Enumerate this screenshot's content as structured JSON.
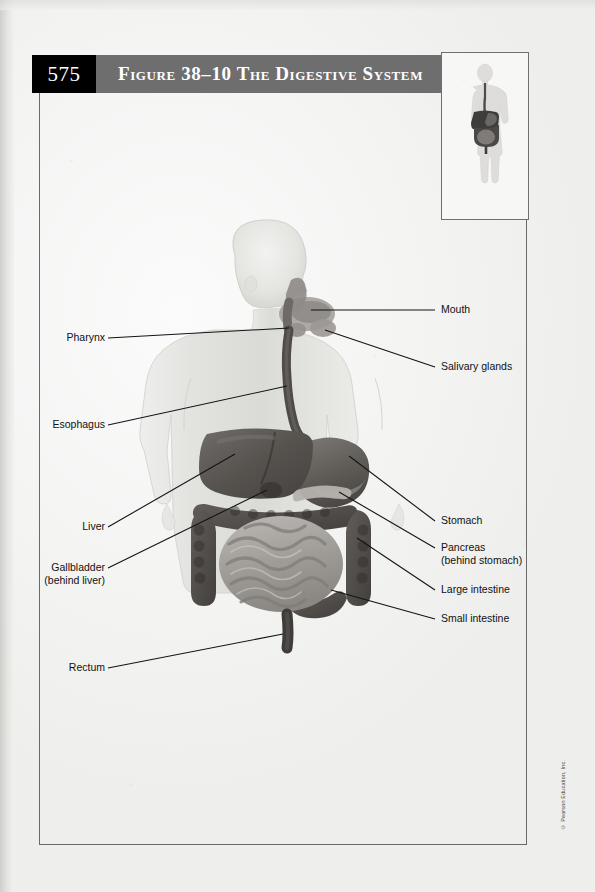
{
  "page": {
    "number": "575",
    "copyright": "© Pearson Education, Inc."
  },
  "header": {
    "figure_label": "Figure 38–10",
    "title": "The Digestive System",
    "full_title": "Figure 38–10  The Digestive System",
    "bar_color": "#6e6e6e",
    "pagenum_box_color": "#000000",
    "text_color": "#ffffff"
  },
  "thumbnail": {
    "name": "body-locator-thumbnail",
    "description": "Full body silhouette with digestive system highlighted"
  },
  "figure": {
    "type": "anatomical-diagram",
    "body_tint": "#e2e2e0",
    "organ_dark": "#5d5b59",
    "organ_mid": "#7c7975",
    "organ_light": "#a8a5a1",
    "leader_color": "#1a1a1a"
  },
  "labels": {
    "left": [
      {
        "id": "pharynx",
        "text": "Pharynx",
        "sub": ""
      },
      {
        "id": "esophagus",
        "text": "Esophagus",
        "sub": ""
      },
      {
        "id": "liver",
        "text": "Liver",
        "sub": ""
      },
      {
        "id": "gallbladder",
        "text": "Gallbladder",
        "sub": "(behind liver)"
      },
      {
        "id": "rectum",
        "text": "Rectum",
        "sub": ""
      }
    ],
    "right": [
      {
        "id": "mouth",
        "text": "Mouth",
        "sub": ""
      },
      {
        "id": "salivary-glands",
        "text": "Salivary glands",
        "sub": ""
      },
      {
        "id": "stomach",
        "text": "Stomach",
        "sub": ""
      },
      {
        "id": "pancreas",
        "text": "Pancreas",
        "sub": "(behind stomach)"
      },
      {
        "id": "large-intestine",
        "text": "Large intestine",
        "sub": ""
      },
      {
        "id": "small-intestine",
        "text": "Small intestine",
        "sub": ""
      }
    ]
  }
}
